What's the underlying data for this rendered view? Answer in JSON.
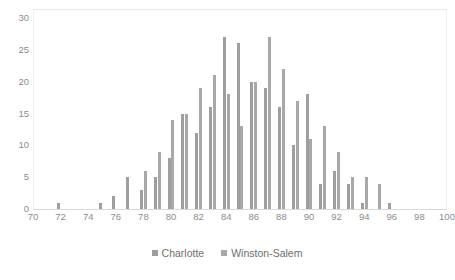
{
  "chart_data": {
    "type": "bar",
    "title": "",
    "subtitle": "",
    "xlabel": "",
    "ylabel": "",
    "xlim": [
      70,
      100
    ],
    "ylim": [
      0,
      30
    ],
    "ytick_step": 5,
    "xtick_step": 2,
    "grid": false,
    "legend_position": "bottom",
    "bar_orientation": "vertical",
    "grouping": "clustered",
    "x_tick_labels": [
      "70",
      "72",
      "74",
      "76",
      "78",
      "80",
      "82",
      "84",
      "86",
      "88",
      "90",
      "92",
      "94",
      "96",
      "98",
      "100"
    ],
    "y_tick_labels": [
      "0",
      "5",
      "10",
      "15",
      "20",
      "25",
      "30"
    ],
    "x": [
      70,
      71,
      72,
      73,
      74,
      75,
      76,
      77,
      78,
      79,
      80,
      81,
      82,
      83,
      84,
      85,
      86,
      87,
      88,
      89,
      90,
      91,
      92,
      93,
      94,
      95,
      96,
      97,
      98,
      99,
      100
    ],
    "series": [
      {
        "name": "Charlotte",
        "color": "#9e9e9e",
        "values": [
          0,
          0,
          1,
          0,
          0,
          1,
          2,
          5,
          3,
          5,
          8,
          15,
          12,
          16,
          27,
          26,
          20,
          19,
          16,
          10,
          18,
          4,
          6,
          4,
          1,
          0,
          1,
          0,
          0,
          0,
          0
        ]
      },
      {
        "name": "Winston-Salem",
        "color": "#a8a8a8",
        "values": [
          0,
          0,
          0,
          0,
          0,
          0,
          0,
          0,
          6,
          9,
          14,
          15,
          19,
          21,
          18,
          13,
          20,
          27,
          22,
          17,
          11,
          13,
          9,
          5,
          5,
          4,
          0,
          0,
          0,
          0,
          0
        ]
      }
    ],
    "series_labels": [
      "Charlotte",
      "Winston-Salem"
    ],
    "colors": {
      "series_1": "#9e9e9e",
      "series_2": "#a8a8a8",
      "axis_line": "#d9d9d9",
      "tick_text": "#8c8c8c",
      "legend_text": "#6e6e6e",
      "plot_border": "#e8e8e8",
      "background": "#ffffff"
    }
  },
  "legend": {
    "items": [
      {
        "label": "Charlotte",
        "color": "#9e9e9e"
      },
      {
        "label": "Winston-Salem",
        "color": "#a8a8a8"
      }
    ]
  }
}
